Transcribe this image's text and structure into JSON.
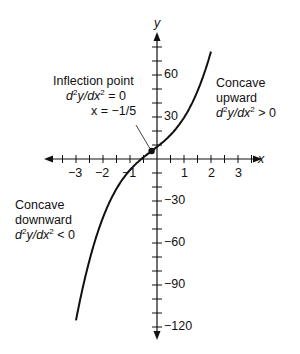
{
  "chart_data": {
    "type": "line",
    "title": "",
    "xlabel": "x",
    "ylabel": "y",
    "xlim": [
      -3.3,
      3.4
    ],
    "ylim": [
      -125,
      85
    ],
    "x_ticks": [
      -3,
      -2,
      -1,
      1,
      2,
      3
    ],
    "y_ticks": [
      60,
      30,
      -30,
      -60,
      -90,
      -120
    ],
    "series": [
      {
        "name": "curve",
        "x_range": [
          -3,
          2
        ],
        "form": "3.65(x+0.2)^3 + 14.6(x+0.2) + 5.7"
      }
    ],
    "inflection_point": {
      "x": -0.2,
      "y": 5.7
    },
    "annotations": {
      "inflection": [
        "Inflection point",
        "d²y/dx² = 0",
        "x = −1/5"
      ],
      "concave_up": [
        "Concave",
        "upward",
        "d²y/dx² > 0"
      ],
      "concave_down": [
        "Concave",
        "downward",
        "d²y/dx² < 0"
      ]
    }
  },
  "labels": {
    "x_axis": "x",
    "y_axis": "y",
    "xt": [
      "−3",
      "−2",
      "−1",
      "1",
      "2",
      "3"
    ],
    "yt": [
      "60",
      "30",
      "−30",
      "−60",
      "−90",
      "−120"
    ],
    "infl1": "Inflection point",
    "infl2_a": "d",
    "infl2_b": "y/dx",
    "infl2_c": " = 0",
    "infl3": "x = −1/5",
    "up1": "Concave",
    "up2": "upward",
    "up3_a": "d",
    "up3_b": "y/dx",
    "up3_c": " > 0",
    "down1": "Concave",
    "down2": "downward",
    "down3_a": "d",
    "down3_b": "y/dx",
    "down3_c": " < 0",
    "sq": "2"
  }
}
